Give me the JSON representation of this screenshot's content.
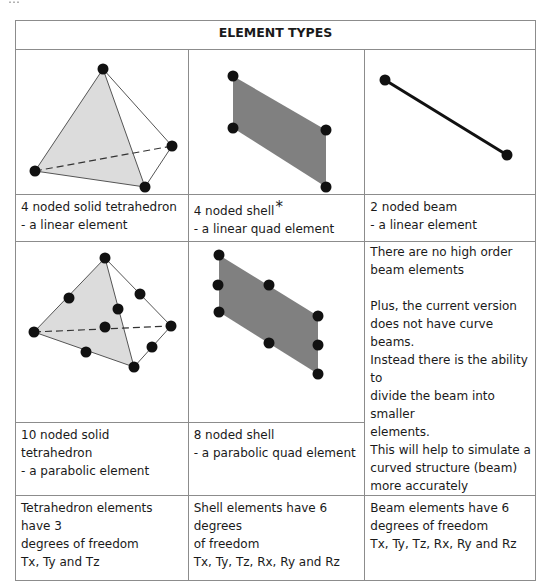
{
  "document": {
    "cropped_top_line": "…",
    "table": {
      "header": "ELEMENT TYPES",
      "rows": [
        {
          "cells": [
            {
              "figure": "4-noded-tetrahedron",
              "fill": "#dcdcdc"
            },
            {
              "figure": "4-noded-shell",
              "fill": "#808080"
            },
            {
              "figure": "2-noded-beam"
            }
          ]
        },
        {
          "cells": [
            {
              "title": "4 noded solid tetrahedron",
              "subtitle": "- a linear element"
            },
            {
              "title": "4 noded shell",
              "marker": "*",
              "subtitle": "- a linear quad element"
            },
            {
              "title": "2 noded beam",
              "subtitle": "- a linear element"
            }
          ]
        },
        {
          "cells": [
            {
              "figure": "10-noded-tetrahedron",
              "fill": "#dcdcdc",
              "title": "10 noded solid tetrahedron",
              "subtitle": "- a parabolic element"
            },
            {
              "figure": "8-noded-shell",
              "fill": "#808080",
              "title": "8 noded shell",
              "subtitle": "- a parabolic quad element"
            },
            {
              "note": {
                "para1": [
                  "There are no high order",
                  "beam elements"
                ],
                "para2": [
                  "Plus, the current version",
                  "does not have curve beams.",
                  "Instead there is the ability to",
                  "divide the beam into smaller",
                  "elements.",
                  "This will help to simulate a",
                  "curved structure (beam)",
                  "more accurately"
                ]
              }
            }
          ]
        },
        {
          "cells": [
            {
              "lines": [
                "Tetrahedron elements have 3",
                "degrees of freedom",
                "Tx, Ty and Tz"
              ]
            },
            {
              "lines": [
                "Shell elements have 6 degrees",
                "of freedom",
                "Tx, Ty, Tz, Rx, Ry and Rz"
              ]
            },
            {
              "lines": [
                "Beam elements have 6",
                "degrees of freedom",
                "Tx, Ty, Tz, Rx, Ry and Rz"
              ]
            }
          ]
        }
      ]
    }
  }
}
